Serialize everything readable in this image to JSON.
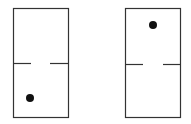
{
  "diagram": {
    "colors": {
      "stroke": "#333333",
      "dot": "#111111",
      "background": "#ffffff"
    },
    "dominoes": [
      {
        "name": "left",
        "top_pips": 0,
        "bottom_pips": 1
      },
      {
        "name": "right",
        "top_pips": 1,
        "bottom_pips": 0
      }
    ]
  }
}
